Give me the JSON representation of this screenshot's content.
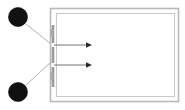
{
  "canvas": {
    "width": 185,
    "height": 110,
    "background": "#ffffff",
    "title": "two-source double-slit schematic"
  },
  "palette": {
    "node_fill": "#111111",
    "node_stroke": "#000000",
    "frame_stroke": "#b9b9b9",
    "inner_frame_stroke": "#c9c9c9",
    "barrier_stroke": "#9a9a9a",
    "leader_stroke": "#b0b0b0",
    "ray_stroke": "#8a8a8a",
    "arrow_fill": "#2a2a2a",
    "tick_stroke": "#aaaaaa"
  },
  "sources": [
    {
      "name": "upper-source-node",
      "label": "",
      "cx": 18,
      "cy": 17,
      "r": 9.5
    },
    {
      "name": "lower-source-node",
      "label": "",
      "cx": 18,
      "cy": 92,
      "r": 9.5
    }
  ],
  "leaders": [
    {
      "name": "upper-leader-line",
      "x1": 26,
      "y1": 24,
      "x2": 51,
      "y2": 44
    },
    {
      "name": "lower-leader-line",
      "x1": 26,
      "y1": 85,
      "x2": 51,
      "y2": 62
    }
  ],
  "barrier": {
    "name": "vertical-barrier",
    "x": 52,
    "y_top": 25,
    "y_bottom": 87,
    "width": 3,
    "segments": [
      {
        "name": "barrier-segment-top",
        "y1": 25,
        "y2": 43
      },
      {
        "name": "barrier-segment-middle",
        "y1": 47,
        "y2": 63
      },
      {
        "name": "barrier-segment-bottom",
        "y1": 67,
        "y2": 87
      }
    ],
    "slits": [
      {
        "name": "upper-slit",
        "y": 45
      },
      {
        "name": "lower-slit",
        "y": 65
      }
    ]
  },
  "frames": [
    {
      "name": "outer-frame",
      "x": 50,
      "y": 8,
      "width": 129,
      "height": 94
    },
    {
      "name": "inner-frame",
      "x": 56,
      "y": 13,
      "width": 119,
      "height": 84
    }
  ],
  "rays": [
    {
      "name": "upper-ray-arrow",
      "x1": 54,
      "y1": 45,
      "x2": 90,
      "y2": 45,
      "arrow": "right"
    },
    {
      "name": "lower-ray-arrow",
      "x1": 54,
      "y1": 65,
      "x2": 90,
      "y2": 65,
      "arrow": "right"
    }
  ],
  "ticks": [
    {
      "name": "aperture-tick-upper",
      "x": 52,
      "y1": 29,
      "y2": 37
    },
    {
      "name": "aperture-tick-lower",
      "x": 52,
      "y1": 72,
      "y2": 80
    }
  ],
  "annotations": {
    "caption": "",
    "units": ""
  }
}
